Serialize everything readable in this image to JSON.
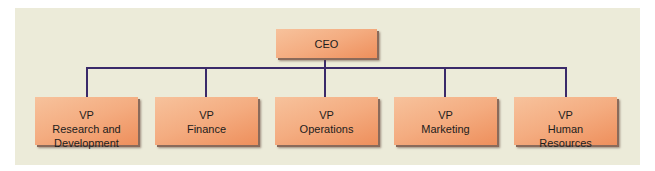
{
  "chart": {
    "type": "org-chart",
    "root": {
      "label": "CEO"
    },
    "children": [
      {
        "title": "VP",
        "department": "Research and",
        "department2": "Development"
      },
      {
        "title": "VP",
        "department": "Finance",
        "department2": ""
      },
      {
        "title": "VP",
        "department": "Operations",
        "department2": ""
      },
      {
        "title": "VP",
        "department": "Marketing",
        "department2": ""
      },
      {
        "title": "VP",
        "department": "Human",
        "department2": "Resources"
      }
    ]
  },
  "colors": {
    "background_panel": "#ecebd9",
    "box_fill_light": "#f7c29c",
    "box_fill_dark": "#ee8f5c",
    "box_shadow": "#8a6a5a",
    "connector": "#3a2a6a"
  }
}
